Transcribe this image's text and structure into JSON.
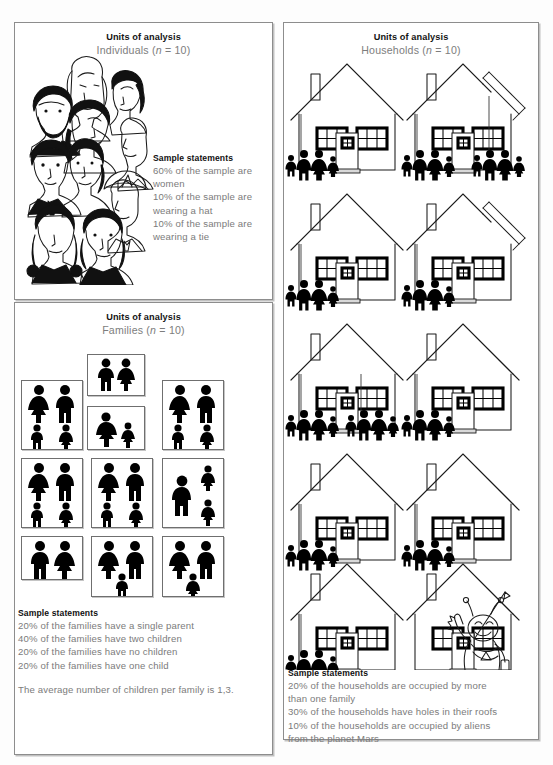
{
  "figure": {
    "background_color": "#fdfdfd",
    "panel_border_color": "#8d8d8d",
    "heading_color": "#141414",
    "body_text_color": "#7b7b7b"
  },
  "panels": {
    "individuals": {
      "heading": "Units of analysis",
      "subheading_prefix": "Individuals (",
      "subheading_italic": "n",
      "subheading_suffix": " = 10)",
      "unit_label": "Individuals",
      "n": 10,
      "statements_title": "Sample statements",
      "statements": [
        "60% of the sample are",
        "women",
        "10% of the sample are",
        "wearing a hat",
        "10% of the sample are",
        "wearing a tie"
      ],
      "illustration": "ten-faces-portrait-collage"
    },
    "families": {
      "heading": "Units of analysis",
      "subheading_prefix": "Families (",
      "subheading_italic": "n",
      "subheading_suffix": " = 10)",
      "unit_label": "Families",
      "n": 10,
      "statements_title": "Sample statements",
      "statements": [
        "20% of the families have a single parent",
        "40% of the families have two children",
        "20% of the families have no children",
        "20% of the families have one child"
      ],
      "summary": "The average number of children per family is 1,3.",
      "boxes": [
        {
          "id": "family-1",
          "adults": 2,
          "children": 2,
          "layout": "2+2"
        },
        {
          "id": "family-2",
          "adults": 2,
          "children": 0,
          "layout": "2+0"
        },
        {
          "id": "family-3",
          "adults": 2,
          "children": 2,
          "layout": "2+2"
        },
        {
          "id": "family-4",
          "adults": 1,
          "children": 1,
          "layout": "1+1"
        },
        {
          "id": "family-5",
          "adults": 2,
          "children": 2,
          "layout": "2+2"
        },
        {
          "id": "family-6",
          "adults": 2,
          "children": 2,
          "layout": "2+2"
        },
        {
          "id": "family-7",
          "adults": 1,
          "children": 2,
          "layout": "1+2"
        },
        {
          "id": "family-8",
          "adults": 2,
          "children": 0,
          "layout": "2+0"
        },
        {
          "id": "family-9",
          "adults": 2,
          "children": 1,
          "layout": "2+1"
        },
        {
          "id": "family-10",
          "adults": 2,
          "children": 1,
          "layout": "2+1"
        }
      ]
    },
    "households": {
      "heading": "Units of analysis",
      "subheading_prefix": "Households (",
      "subheading_italic": "n",
      "subheading_suffix": " = 10)",
      "unit_label": "Households",
      "n": 10,
      "statements_title": "Sample statements",
      "statements": [
        "20% of the households are occupied by more",
        "than one family",
        "30% of the households have holes in their roofs",
        "10% of the households are occupied by aliens",
        "from the planet Mars"
      ],
      "house_rows": [
        {
          "row": 1,
          "houses": [
            {
              "id": "house-1",
              "roof": "intact",
              "occupants": 4,
              "occupant_groups": [
                4
              ]
            },
            {
              "id": "house-2",
              "roof": "hole-in-roof",
              "occupants": 7,
              "occupant_groups": [
                4,
                3
              ]
            }
          ]
        },
        {
          "row": 2,
          "houses": [
            {
              "id": "house-3",
              "roof": "intact",
              "occupants": 4,
              "occupant_groups": [
                4
              ]
            },
            {
              "id": "house-4",
              "roof": "hole-in-roof",
              "occupants": 4,
              "occupant_groups": [
                4
              ]
            }
          ]
        },
        {
          "row": 3,
          "houses": [
            {
              "id": "house-5",
              "roof": "intact",
              "occupants": 8,
              "occupant_groups": [
                4,
                4
              ]
            },
            {
              "id": "house-6",
              "roof": "intact",
              "occupants": 4,
              "occupant_groups": [
                4
              ]
            }
          ]
        },
        {
          "row": 4,
          "houses": [
            {
              "id": "house-7",
              "roof": "intact",
              "occupants": 4,
              "occupant_groups": [
                4
              ]
            },
            {
              "id": "house-8",
              "roof": "intact",
              "occupants": 4,
              "occupant_groups": [
                4
              ]
            }
          ]
        },
        {
          "row": 5,
          "houses": [
            {
              "id": "house-9",
              "roof": "intact",
              "occupants": 4,
              "occupant_groups": [
                4
              ]
            },
            {
              "id": "house-10",
              "roof": "intact",
              "occupants": 0,
              "occupant_groups": [],
              "special": "occupied-by-alien"
            }
          ]
        }
      ]
    }
  }
}
